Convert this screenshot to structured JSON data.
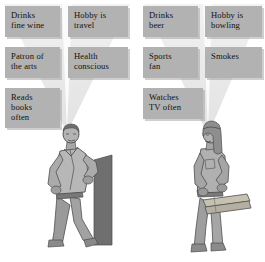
{
  "figure": {
    "type": "illustration-diagram",
    "background_color": "#ffffff",
    "label_box_color": "#b2b2b2",
    "cone_color": "#eaeaea",
    "ink_color": "#5a5a5a"
  },
  "left_panel": {
    "name": "left-person-panel",
    "person": {
      "name": "leaning-man-figure",
      "description": "Man in open shirt and trousers leaning against a dark pillar, arms crossed",
      "pillar_color": "#6e6e6e"
    },
    "labels": [
      {
        "id": "drinks-fine-wine",
        "lines": [
          "Drinks",
          "fine wine"
        ],
        "x": 5,
        "y": 6,
        "w": 55,
        "h": 31
      },
      {
        "id": "hobby-is-travel",
        "lines": [
          "Hobby is",
          "travel"
        ],
        "x": 68,
        "y": 6,
        "w": 60,
        "h": 31
      },
      {
        "id": "patron-of-the-arts",
        "lines": [
          "Patron of",
          "the arts"
        ],
        "x": 5,
        "y": 47,
        "w": 55,
        "h": 31
      },
      {
        "id": "health-conscious",
        "lines": [
          "Health",
          "conscious"
        ],
        "x": 68,
        "y": 47,
        "w": 60,
        "h": 31
      },
      {
        "id": "reads-books-often",
        "lines": [
          "Reads",
          "books",
          "often"
        ],
        "x": 5,
        "y": 88,
        "w": 55,
        "h": 40
      }
    ]
  },
  "right_panel": {
    "name": "right-person-panel",
    "person": {
      "name": "lumber-carrying-man-figure",
      "description": "Long-haired man in work shirt and jeans carrying wooden planks at his side",
      "plank_color": "#c9c4b4"
    },
    "labels": [
      {
        "id": "drinks-beer",
        "lines": [
          "Drinks",
          "beer"
        ],
        "x": 143,
        "y": 6,
        "w": 55,
        "h": 31
      },
      {
        "id": "hobby-is-bowling",
        "lines": [
          "Hobby is",
          "bowling"
        ],
        "x": 205,
        "y": 6,
        "w": 57,
        "h": 31
      },
      {
        "id": "sports-fan",
        "lines": [
          "Sports",
          "fan"
        ],
        "x": 143,
        "y": 47,
        "w": 55,
        "h": 31
      },
      {
        "id": "smokes",
        "lines": [
          "Smokes"
        ],
        "x": 205,
        "y": 47,
        "w": 57,
        "h": 31
      },
      {
        "id": "watches-tv-often",
        "lines": [
          "Watches",
          "TV often"
        ],
        "x": 143,
        "y": 88,
        "w": 60,
        "h": 31
      }
    ]
  }
}
